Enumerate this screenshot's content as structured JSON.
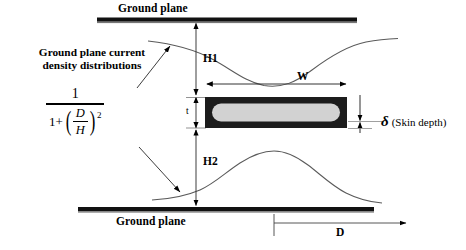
{
  "figure": {
    "type": "cross-section-diagram"
  },
  "labels": {
    "ground_plane_top": "Ground plane",
    "ground_plane_bottom": "Ground plane",
    "caption_line1": "Ground plane current",
    "caption_line2": "density distributions",
    "h1": "H1",
    "h2": "H2",
    "t": "t",
    "w": "W",
    "d": "D",
    "delta_symbol": "δ",
    "delta_text": "(Skin depth)"
  },
  "formula": {
    "numerator": "1",
    "denominator_prefix": "1+",
    "inner_numerator": "D",
    "inner_denominator": "H",
    "exponent": "2",
    "expression": "1 / (1 + (D/H)^2)"
  },
  "colors": {
    "ink": "#000000",
    "background": "#ffffff",
    "conductor_skin": "#1a1a1a",
    "conductor_core": "#d0d0d0",
    "curve": "#555555"
  },
  "geometry": {
    "ground_plane_top_y": 20,
    "ground_plane_bottom_y": 209,
    "conductor_left_x": 205,
    "conductor_right_x": 347,
    "conductor_top_y": 97,
    "conductor_bottom_y": 128,
    "skin_depth_px": 7
  }
}
